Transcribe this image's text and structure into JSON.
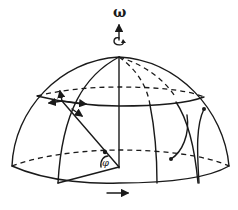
{
  "diagram": {
    "labels": {
      "omega": "ω",
      "phi": "φ"
    },
    "colors": {
      "ink": "#1a1a1a",
      "background": "#ffffff"
    },
    "elements": {
      "rotation_axis": "vertical axis through the pole with upward arrow",
      "rotation_curl": "curved arrow indicating rotation direction",
      "latitude_circle": "solid front / dashed back circle of latitude",
      "equator": "dashed back equator line",
      "meridians": "solid and dashed meridian lines",
      "tangent_vectors": "arrows at point on latitude circle",
      "radius_line": "line from center to surface point with latitude angle φ",
      "deflection_paths": "curved trajectories on the right side",
      "direction_arrow": "arrow below the dome pointing right"
    }
  }
}
